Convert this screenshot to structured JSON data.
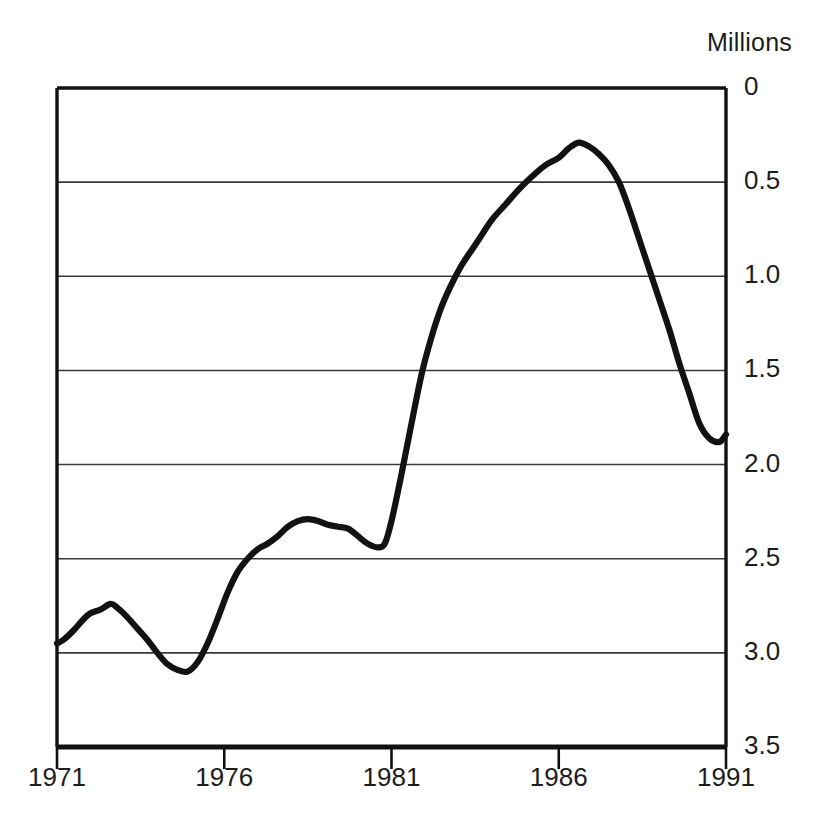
{
  "axis": {
    "unit_label": "Millions",
    "y_ticks": [
      "3.5",
      "3.0",
      "2.5",
      "2.0",
      "1.5",
      "1.0",
      "0.5",
      "0"
    ],
    "x_ticks": [
      "1971",
      "1976",
      "1981",
      "1986",
      "1991"
    ]
  },
  "style": {
    "line_color": "#121212",
    "frame_color": "#111111",
    "grid_color": "#3a3a3a",
    "background": "#ffffff"
  },
  "chart_data": {
    "type": "line",
    "title": "",
    "subtitle": "",
    "xlabel": "",
    "ylabel": "Millions",
    "unit_label": "Millions",
    "xlim": [
      1971,
      1991
    ],
    "ylim": [
      0,
      3.5
    ],
    "x_ticks": [
      1971,
      1976,
      1981,
      1986,
      1991
    ],
    "y_ticks": [
      0,
      0.5,
      1.0,
      1.5,
      2.0,
      2.5,
      3.0,
      3.5
    ],
    "grid": "horizontal",
    "legend": "none",
    "series": [
      {
        "name": "value",
        "x": [
          1971.0,
          1971.2,
          1971.5,
          1971.8,
          1972.0,
          1972.3,
          1972.6,
          1972.8,
          1973.1,
          1973.4,
          1973.7,
          1974.0,
          1974.3,
          1974.6,
          1974.9,
          1975.2,
          1975.5,
          1975.8,
          1976.1,
          1976.4,
          1976.7,
          1977.0,
          1977.3,
          1977.6,
          1977.9,
          1978.2,
          1978.5,
          1978.8,
          1979.1,
          1979.4,
          1979.7,
          1980.0,
          1980.2,
          1980.4,
          1980.6,
          1980.8,
          1981.0,
          1981.3,
          1981.6,
          1981.9,
          1982.2,
          1982.5,
          1982.8,
          1983.1,
          1983.4,
          1983.7,
          1984.0,
          1984.4,
          1984.8,
          1985.2,
          1985.6,
          1986.0,
          1986.3,
          1986.6,
          1986.9,
          1987.2,
          1987.5,
          1987.8,
          1988.1,
          1988.4,
          1988.7,
          1989.0,
          1989.3,
          1989.6,
          1989.9,
          1990.2,
          1990.5,
          1990.8,
          1991.0
        ],
        "y": [
          0.55,
          0.57,
          0.62,
          0.68,
          0.71,
          0.73,
          0.76,
          0.74,
          0.69,
          0.63,
          0.57,
          0.5,
          0.44,
          0.41,
          0.4,
          0.45,
          0.55,
          0.68,
          0.82,
          0.93,
          1.0,
          1.05,
          1.08,
          1.12,
          1.17,
          1.2,
          1.21,
          1.2,
          1.18,
          1.17,
          1.16,
          1.12,
          1.09,
          1.07,
          1.06,
          1.08,
          1.2,
          1.45,
          1.72,
          1.98,
          2.18,
          2.34,
          2.46,
          2.56,
          2.64,
          2.72,
          2.8,
          2.88,
          2.96,
          3.03,
          3.09,
          3.13,
          3.18,
          3.21,
          3.19,
          3.15,
          3.09,
          3.0,
          2.86,
          2.7,
          2.54,
          2.38,
          2.22,
          2.04,
          1.88,
          1.72,
          1.64,
          1.62,
          1.66
        ]
      }
    ]
  }
}
